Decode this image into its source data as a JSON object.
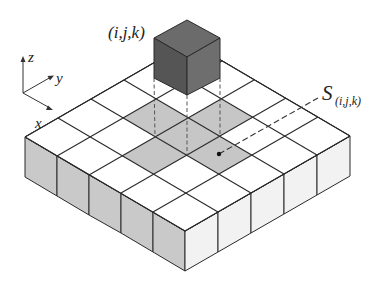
{
  "diagram": {
    "type": "isometric-voxel-grid",
    "grid_size": [
      5,
      5
    ],
    "cube_label": "(i,j,k)",
    "surface_label_main": "S",
    "surface_label_sub": "(i,j,k)",
    "axes": {
      "x": "x",
      "y": "y",
      "z": "z"
    },
    "shaded_cells_description": "target cell and its 4 edge neighbors (cross pattern) below the cube",
    "colors": {
      "cube_top": "#6b6b6b",
      "cube_left": "#555555",
      "cube_right": "#6e6e6e",
      "shaded_cell": "#c6c6c6",
      "top_cell": "#ffffff",
      "left_side": "#c9c9c9",
      "right_side": "#f2f2f2",
      "line": "#2a2a2a"
    }
  }
}
